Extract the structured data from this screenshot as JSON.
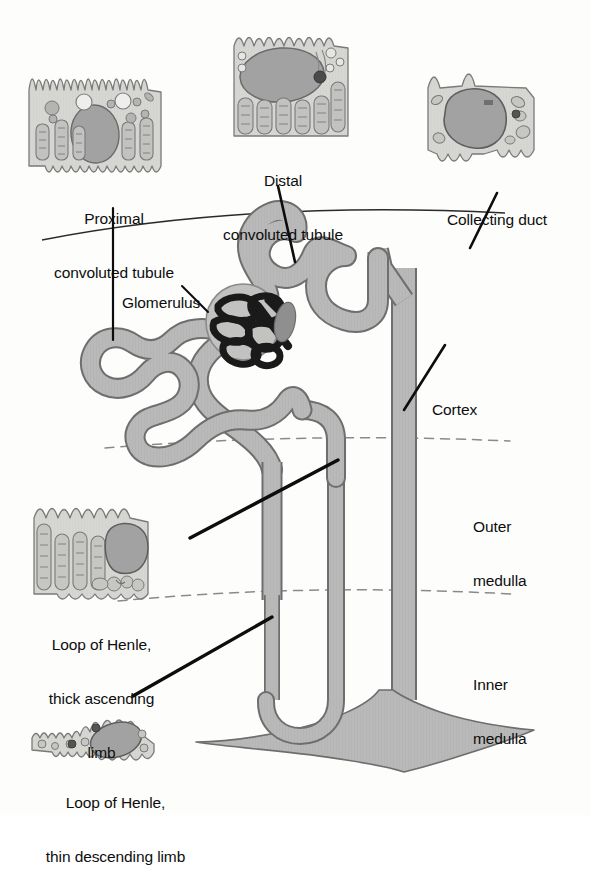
{
  "figure": {
    "type": "diagram",
    "background_color": "#fdfdfc",
    "ink_color": "#0d0d0d",
    "tubule_fill": "#b9b9b9",
    "tubule_stroke": "#6e6e6e",
    "cell_cytoplasm": "#d4d4d2",
    "cell_nucleus": "#a8a8a8",
    "capillary_color": "#1a1a1a",
    "zone_divider_color": "#8a8a8a"
  },
  "labels": {
    "proximal_convoluted_tubule": {
      "line1": "Proximal",
      "line2": "convoluted tubule"
    },
    "distal_convoluted_tubule": {
      "line1": "Distal",
      "line2": "convoluted tubule"
    },
    "collecting_duct": {
      "line1": "Collecting duct"
    },
    "glomerulus": {
      "line1": "Glomerulus"
    },
    "cortex": {
      "line1": "Cortex"
    },
    "outer_medulla": {
      "line1": "Outer",
      "line2": "medulla"
    },
    "inner_medulla": {
      "line1": "Inner",
      "line2": "medulla"
    },
    "loop_thick_ascending": {
      "line1": "Loop of Henle,",
      "line2": "thick ascending",
      "line3": "limb"
    },
    "loop_thin_descending": {
      "line1": "Loop of Henle,",
      "line2": "thin descending limb"
    }
  },
  "zones": [
    {
      "name": "Cortex",
      "order": 1
    },
    {
      "name": "Outer medulla",
      "order": 2
    },
    {
      "name": "Inner medulla",
      "order": 3
    }
  ],
  "cell_insets": [
    {
      "id": "proximal-tubule-cell",
      "label": "Proximal convoluted tubule",
      "features": "brush border microvilli, mitochondria, oval nucleus, vesicles"
    },
    {
      "id": "distal-tubule-cell",
      "label": "Distal convoluted tubule",
      "features": "large oval nucleus, basal mitochondria, apical folds"
    },
    {
      "id": "collecting-duct-cell",
      "label": "Collecting duct",
      "features": "large polygonal nucleus, sparse organelles, few microvilli"
    },
    {
      "id": "thick-ascending-limb-cell",
      "label": "Loop of Henle, thick ascending limb",
      "features": "tall basal mitochondria, large nucleus, lysosomes"
    },
    {
      "id": "thin-descending-limb-cell",
      "label": "Loop of Henle, thin descending limb",
      "features": "flattened squamous cell, tilted oval nucleus"
    }
  ],
  "structures": [
    {
      "id": "renal-capsule-arc",
      "name": "Renal capsule outline"
    },
    {
      "id": "glomerulus-tuft",
      "name": "Glomerular capillary tuft"
    },
    {
      "id": "bowmans-capsule",
      "name": "Bowman's capsule"
    },
    {
      "id": "proximal-tubule-path",
      "name": "Proximal convoluted tubule"
    },
    {
      "id": "descending-limb-path",
      "name": "Descending limb of loop of Henle"
    },
    {
      "id": "ascending-limb-path",
      "name": "Ascending limb of loop of Henle"
    },
    {
      "id": "distal-tubule-path",
      "name": "Distal convoluted tubule"
    },
    {
      "id": "collecting-duct-path",
      "name": "Collecting duct"
    },
    {
      "id": "papilla",
      "name": "Papillary opening"
    }
  ]
}
